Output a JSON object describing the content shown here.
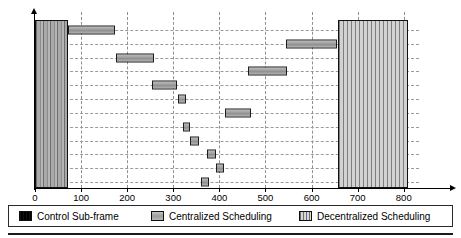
{
  "chart_data": {
    "type": "bar",
    "orientation": "horizontal",
    "title": "",
    "xlabel": "",
    "ylabel": "",
    "xlim": [
      0,
      820
    ],
    "ylim_categories": [
      "e1",
      "e2",
      "e3",
      "e4",
      "e5",
      "e6",
      "e7",
      "e8",
      "e9",
      "e10",
      "e11",
      "e12"
    ],
    "xticks": [
      0,
      100,
      200,
      300,
      400,
      500,
      600,
      700,
      800
    ],
    "xticklabels": [
      "0",
      "100",
      "200",
      "300",
      "400",
      "500",
      "600",
      "700",
      "800"
    ],
    "ytick_labels": [
      "e1",
      "e2",
      "e3",
      "e4",
      "e5",
      "e6",
      "e7",
      "e8",
      "e9",
      "e10",
      "e11",
      "e12"
    ],
    "ytick_base": [
      "e",
      "e",
      "e",
      "e",
      "e",
      "e",
      "e",
      "e",
      "e",
      "e",
      "e",
      "e"
    ],
    "ytick_sub": [
      "1",
      "2",
      "3",
      "4",
      "5",
      "6",
      "7",
      "8",
      "9",
      "10",
      "11",
      "12"
    ],
    "grid": true,
    "grid_style": "dashed",
    "legend_position": "bottom",
    "series": [
      {
        "name": "Control Sub-frame",
        "type": "span-block",
        "start": 0,
        "end": 72,
        "spans_all_rows": true
      },
      {
        "name": "Centralized Scheduling",
        "type": "gantt",
        "bars": [
          {
            "row": "e1",
            "start": 72,
            "end": 174
          },
          {
            "row": "e2",
            "start": 544,
            "end": 656
          },
          {
            "row": "e3",
            "start": 176,
            "end": 258
          },
          {
            "row": "e4",
            "start": 461,
            "end": 546
          },
          {
            "row": "e5",
            "start": 254,
            "end": 307
          },
          {
            "row": "e6",
            "start": 311,
            "end": 328
          },
          {
            "row": "e7",
            "start": 413,
            "end": 468
          },
          {
            "row": "e8",
            "start": 322,
            "end": 337
          },
          {
            "row": "e9",
            "start": 337,
            "end": 356
          },
          {
            "row": "e10",
            "start": 373,
            "end": 392
          },
          {
            "row": "e11",
            "start": 392,
            "end": 411
          },
          {
            "row": "e12",
            "start": 360,
            "end": 377
          }
        ]
      },
      {
        "name": "Decentralized Scheduling",
        "type": "span-block",
        "start": 658,
        "end": 810,
        "spans_all_rows": true
      }
    ]
  },
  "legend": {
    "items": [
      {
        "label": "Control Sub-frame",
        "swatch": "control-swatch"
      },
      {
        "label": "Centralized Scheduling",
        "swatch": "centralized-swatch"
      },
      {
        "label": "Decentralized Scheduling",
        "swatch": "decentralized-swatch"
      }
    ]
  }
}
